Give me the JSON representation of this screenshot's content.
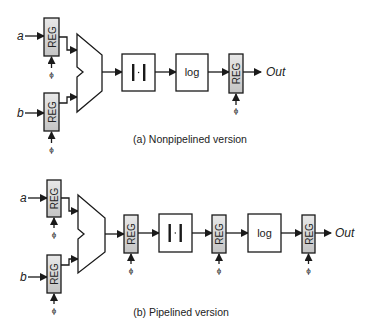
{
  "labels": {
    "reg": "REG",
    "abs": "|·|",
    "log": "log",
    "out": "Out",
    "clock": "ϕ",
    "input_a": "a",
    "input_b": "b"
  },
  "captions": {
    "a": "(a) Nonpipelined version",
    "b": "(b) Pipelined version"
  },
  "colors": {
    "stroke": "#1a1a1a",
    "reg_fill_top": "#e6e6e6",
    "reg_fill_bottom": "#c6c6c6",
    "block_fill": "#ffffff"
  },
  "diagrams": [
    {
      "name": "nonpipelined",
      "blocks": [
        "REG a",
        "REG b",
        "MUX",
        "|·|",
        "log",
        "REG"
      ]
    },
    {
      "name": "pipelined",
      "blocks": [
        "REG a",
        "REG b",
        "MUX",
        "REG",
        "|·|",
        "REG",
        "log",
        "REG"
      ]
    }
  ]
}
